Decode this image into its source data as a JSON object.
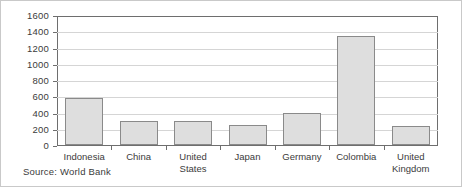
{
  "chart_data": {
    "type": "bar",
    "title": "",
    "xlabel": "",
    "ylabel": "",
    "categories": [
      "Indonesia",
      "China",
      "United States",
      "Japan",
      "Germany",
      "Colombia",
      "United Kingdom"
    ],
    "values": [
      575,
      290,
      290,
      245,
      395,
      1345,
      230
    ],
    "ylim": [
      0,
      1600
    ],
    "ytick_values": [
      0,
      200,
      400,
      600,
      800,
      1000,
      1200,
      1400,
      1600
    ],
    "ytick_labels": [
      "0",
      "200",
      "400",
      "600",
      "800",
      "1000",
      "1200",
      "1400",
      "1600"
    ],
    "grid": true,
    "legend": false,
    "legend_position": "none",
    "bar_fill_color": "#dedede",
    "bar_border_color": "#8a8a8a",
    "gridline_color": "#d5d5d5",
    "axis_color": "#6e6e6e",
    "text_color": "#3b3b3b",
    "annotations": [
      "Source: World Bank"
    ]
  },
  "figure": {
    "source_note": "Source: World Bank",
    "category_labels": [
      {
        "line1": "Indonesia",
        "line2": ""
      },
      {
        "line1": "China",
        "line2": ""
      },
      {
        "line1": "United States",
        "line2": ""
      },
      {
        "line1": "Japan",
        "line2": ""
      },
      {
        "line1": "Germany",
        "line2": ""
      },
      {
        "line1": "Colombia",
        "line2": ""
      },
      {
        "line1": "United",
        "line2": "Kingdom"
      }
    ]
  }
}
